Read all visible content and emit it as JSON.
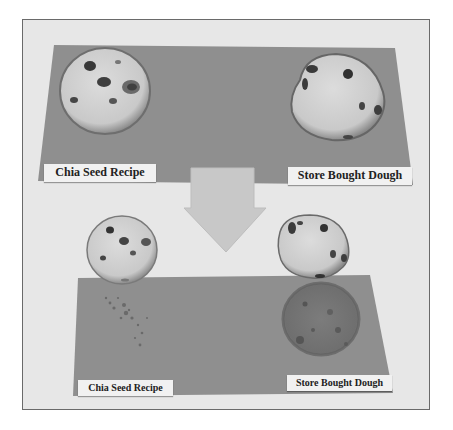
{
  "photo": {
    "description": "Grayscale photo comparing cookies baked from a chia seed recipe vs store bought dough, before and after grease test on paper",
    "colors": {
      "background": "#e6e6e6",
      "paper": "#8e8e8e",
      "cookie": "#cfcfcf",
      "chip": "#3a3a3a",
      "arrow": "#c6c6c6",
      "frame_border": "#6a6a6a"
    },
    "top_panel": {
      "left_label": "Chia Seed Recipe",
      "right_label": "Store Bought Dough"
    },
    "bottom_panel": {
      "left_label": "Chia Seed Recipe",
      "right_label": "Store Bought Dough"
    },
    "arrow": "down-arrow"
  }
}
